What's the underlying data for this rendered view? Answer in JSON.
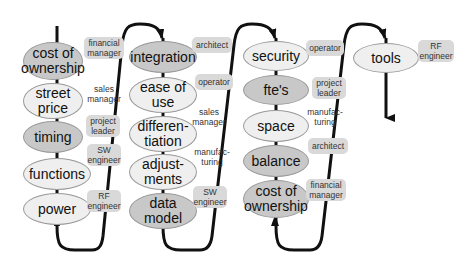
{
  "columns": [
    {
      "items": [
        {
          "label": "cost of ownership",
          "shade": "dark",
          "role": "financial manager"
        },
        {
          "label": "street price",
          "shade": "light",
          "role": "sales manager"
        },
        {
          "label": "timing",
          "shade": "dark",
          "role": "project leader"
        },
        {
          "label": "functions",
          "shade": "light",
          "role": "SW engineer"
        },
        {
          "label": "power",
          "shade": "light",
          "role": "RF engineer"
        }
      ]
    },
    {
      "items": [
        {
          "label": "integration",
          "shade": "dark",
          "role": "architect"
        },
        {
          "label": "ease of use",
          "shade": "light",
          "role": "operator"
        },
        {
          "label": "differen-tiation",
          "shade": "light",
          "role": "sales manager"
        },
        {
          "label": "adjust-ments",
          "shade": "light",
          "role": "manufac-turing"
        },
        {
          "label": "data model",
          "shade": "light",
          "role": "SW engineer"
        }
      ]
    },
    {
      "items": [
        {
          "label": "security",
          "shade": "light",
          "role": "operator"
        },
        {
          "label": "fte's",
          "shade": "dark",
          "role": "project leader"
        },
        {
          "label": "space",
          "shade": "light",
          "role": "manufac-turing"
        },
        {
          "label": "balance",
          "shade": "dark",
          "role": "architect"
        },
        {
          "label": "cost of ownership",
          "shade": "light",
          "role": "financial manager"
        }
      ]
    },
    {
      "items": [
        {
          "label": "tools",
          "shade": "light",
          "role": "RF engineer"
        }
      ]
    }
  ],
  "colors": {
    "dark_node": "#c8c8c8",
    "light_node": "#efefef",
    "role_box": "#d9d9d9",
    "line": "#111111"
  }
}
